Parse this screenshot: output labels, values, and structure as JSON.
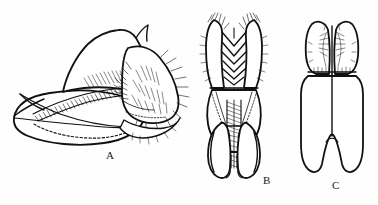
{
  "plate": {
    "kind": "scientific-line-drawing-plate",
    "background_color": "#fefefe",
    "ink_color": "#111111",
    "width": 378,
    "height": 205,
    "figures": [
      {
        "id": "A",
        "label": "A",
        "label_x": 106,
        "label_y": 150,
        "view": "lateral",
        "description": "Lateral view of male genitalic capsule: elongate pointed basal piece at left, a broad dorsal plate with dense diagonal hatching along its ventral margin, a dashed internal outline within the lower lobe, and a setose spiny lobe at the right bearing numerous stout bristles.",
        "elements": [
          "basal-apex-spur",
          "dorsal-plate",
          "hatched-band",
          "ventral-lobe",
          "dashed-internal-margin",
          "setose-lateral-lobe",
          "apical-spines"
        ]
      },
      {
        "id": "B",
        "label": "B",
        "label_x": 263,
        "label_y": 175,
        "view": "dorsal",
        "description": "Dorsal view: paired setose apical lobes at top flanking a series of nested chevron-shaped transverse bands, a median hatched column tapering posteriorly, faint dotted internal margins, and two elongate paired arms forming a U at the base.",
        "elements": [
          "paired-apical-lobes",
          "chevron-bands",
          "fringe-row",
          "median-hatched-column",
          "dotted-internal-margins",
          "paired-basal-arms"
        ]
      },
      {
        "id": "C",
        "label": "C",
        "label_x": 332,
        "label_y": 180,
        "view": "ventral",
        "description": "Ventral view of a simpler sclerite: two rounded setose apical lobes separated by a median cleft, a broad rectangular body with a median longitudinal line, and two long parallel posterior arms separated by a narrow V-shaped notch.",
        "elements": [
          "apical-lobes",
          "median-suture",
          "body-plate",
          "posterior-arms",
          "basal-notch"
        ]
      }
    ]
  }
}
